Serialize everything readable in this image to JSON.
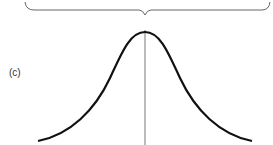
{
  "figure": {
    "panel_label": "(c)",
    "colors": {
      "curve": "#111111",
      "center_line": "#555555",
      "brace": "#666666",
      "background": "#ffffff"
    }
  }
}
